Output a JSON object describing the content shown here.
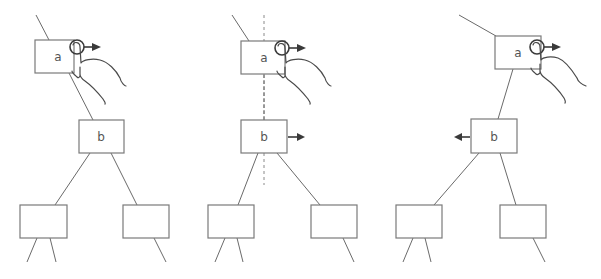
{
  "diagram": {
    "colors": {
      "background": "#ffffff",
      "node_stroke": "#7a7a7a",
      "edge": "#6a6a6a",
      "arrow": "#3a3a3a",
      "text": "#555555"
    },
    "panels": [
      {
        "id": "panel-1",
        "nodes": [
          {
            "id": "a",
            "label": "a"
          },
          {
            "id": "b",
            "label": "b"
          },
          {
            "id": "c",
            "label": ""
          },
          {
            "id": "d",
            "label": ""
          }
        ],
        "gesture": "drag-right-on-a",
        "arrows": [
          "right-from-a"
        ]
      },
      {
        "id": "panel-2",
        "nodes": [
          {
            "id": "a",
            "label": "a"
          },
          {
            "id": "b",
            "label": "b"
          },
          {
            "id": "c",
            "label": ""
          },
          {
            "id": "d",
            "label": ""
          }
        ],
        "gesture": "drag-right-on-a",
        "arrows": [
          "right-from-a",
          "right-from-b"
        ],
        "guide": "dashed-vertical-alignment-line"
      },
      {
        "id": "panel-3",
        "nodes": [
          {
            "id": "a",
            "label": "a"
          },
          {
            "id": "b",
            "label": "b"
          },
          {
            "id": "c",
            "label": ""
          },
          {
            "id": "d",
            "label": ""
          }
        ],
        "gesture": "drag-right-on-a",
        "arrows": [
          "right-from-a",
          "left-from-b"
        ]
      }
    ]
  }
}
